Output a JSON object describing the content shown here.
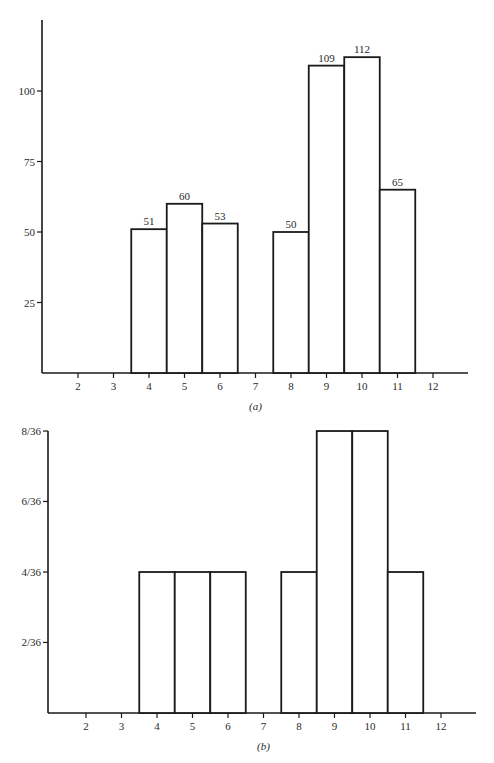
{
  "chart_data": [
    {
      "type": "bar",
      "panel": "a",
      "caption": "(a)",
      "title": "",
      "xlabel": "",
      "ylabel": "",
      "categories": [
        2,
        3,
        4,
        5,
        6,
        7,
        8,
        9,
        10,
        11,
        12
      ],
      "values": [
        0,
        0,
        51,
        60,
        53,
        0,
        50,
        109,
        112,
        65,
        0
      ],
      "data_labels": [
        "",
        "",
        "51",
        "60",
        "53",
        "",
        "50",
        "109",
        "112",
        "65",
        ""
      ],
      "y_ticks": [
        25,
        50,
        75,
        100
      ],
      "y_tick_labels": [
        "25",
        "50",
        "75",
        "100"
      ],
      "x_tick_labels": [
        "2",
        "3",
        "4",
        "5",
        "6",
        "7",
        "8",
        "9",
        "10",
        "11",
        "12"
      ],
      "ylim": [
        0,
        125
      ],
      "grid": false,
      "legend": null
    },
    {
      "type": "bar",
      "panel": "b",
      "caption": "(b)",
      "title": "",
      "xlabel": "",
      "ylabel": "",
      "categories": [
        2,
        3,
        4,
        5,
        6,
        7,
        8,
        9,
        10,
        11,
        12
      ],
      "values": [
        0,
        0,
        0.1111,
        0.1111,
        0.1111,
        0,
        0.1111,
        0.2222,
        0.2222,
        0.1111,
        0
      ],
      "values_fraction": [
        "0",
        "0",
        "4/36",
        "4/36",
        "4/36",
        "0",
        "4/36",
        "8/36",
        "8/36",
        "4/36",
        "0"
      ],
      "y_ticks": [
        0.0556,
        0.1111,
        0.1667,
        0.2222
      ],
      "y_tick_labels": [
        "2/36",
        "4/36",
        "6/36",
        "8/36"
      ],
      "x_tick_labels": [
        "2",
        "3",
        "4",
        "5",
        "6",
        "7",
        "8",
        "9",
        "10",
        "11",
        "12"
      ],
      "ylim": [
        0,
        0.2222
      ],
      "grid": false,
      "legend": null
    }
  ],
  "layout": {
    "a": {
      "x0": 42,
      "base": 373,
      "top": 20,
      "right": 468,
      "unit_px": 35.5,
      "first_x": 78,
      "px_per_value": 2.82
    },
    "b": {
      "x0": 48,
      "base": 713,
      "top": 431,
      "right": 476,
      "unit_px": 35.5,
      "first_x": 86,
      "px_per_value": 1269
    }
  }
}
